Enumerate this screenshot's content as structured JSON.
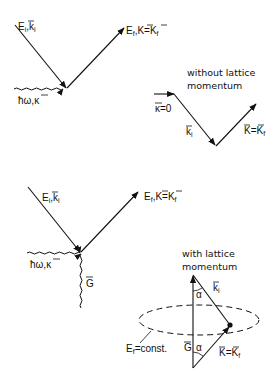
{
  "diagram": {
    "top": {
      "incoming_label": "E_i, k_i",
      "incoming_main": "E",
      "incoming_sub": "i",
      "incoming_vec": "k",
      "incoming_vec_sub": "i",
      "outgoing_main": "E",
      "outgoing_sub": "f",
      "outgoing_vec": "K",
      "outgoing_eq": "=",
      "outgoing_vec2": "K",
      "outgoing_vec2_sub": "f",
      "photon_main": "ħω,",
      "photon_vec": "κ"
    },
    "without_lattice": {
      "caption_line1": "without lattice",
      "caption_line2": "momentum",
      "kappa_label": "κ",
      "kappa_eq": "=0",
      "ki_vec": "k",
      "ki_sub": "i",
      "kf_vec": "K",
      "kf_eq": "=",
      "kf_vec2": "K",
      "kf_sub": "f"
    },
    "bottom": {
      "incoming_main": "E",
      "incoming_sub": "i",
      "incoming_vec": "k",
      "incoming_vec_sub": "i",
      "outgoing_main": "E",
      "outgoing_sub": "f",
      "outgoing_vec": "K",
      "outgoing_eq": "=",
      "outgoing_vec2": "K",
      "outgoing_vec2_sub": "f",
      "photon_main": "ħω,",
      "photon_vec": "κ",
      "lattice_vec": "G"
    },
    "with_lattice": {
      "caption_line1": "with lattice",
      "caption_line2": "momentum",
      "alpha_top": "α",
      "alpha_bottom": "α",
      "ki_vec": "k",
      "ki_sub": "i",
      "g_vec": "G",
      "kf_vec": "K",
      "kf_eq": "=",
      "kf_vec2": "K",
      "kf_sub": "f",
      "ef_main": "E",
      "ef_sub": "f",
      "ef_rest": "=const."
    }
  }
}
